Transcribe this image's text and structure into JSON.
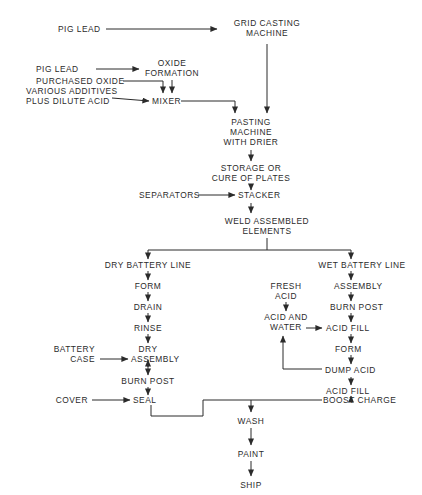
{
  "diagram": {
    "line_color": "#2b2b2b",
    "background": "#ffffff",
    "nodes": {
      "pig_lead_1": "PIG LEAD",
      "grid_casting_l1": "GRID CASTING",
      "grid_casting_l2": "MACHINE",
      "pig_lead_2": "PIG LEAD",
      "purchased_oxide": "PURCHASED OXIDE",
      "oxide_formation_l1": "OXIDE",
      "oxide_formation_l2": "FORMATION",
      "various_additives_l1": "VARIOUS ADDITIVES",
      "various_additives_l2": "PLUS DILUTE ACID",
      "mixer": "MIXER",
      "pasting_l1": "PASTING",
      "pasting_l2": "MACHINE",
      "pasting_l3": "WITH DRIER",
      "storage_l1": "STORAGE OR",
      "storage_l2": "CURE OF PLATES",
      "separators": "SEPARATORS",
      "stacker": "STACKER",
      "weld_l1": "WELD ASSEMBLED",
      "weld_l2": "ELEMENTS",
      "dry_battery_line": "DRY BATTERY LINE",
      "dry_form": "FORM",
      "dry_drain": "DRAIN",
      "dry_rinse": "RINSE",
      "dry_dry": "DRY",
      "battery_case_l1": "BATTERY",
      "battery_case_l2": "CASE",
      "dry_assembly": "ASSEMBLY",
      "dry_burn_post": "BURN POST",
      "cover": "COVER",
      "seal": "SEAL",
      "wet_battery_line": "WET BATTERY LINE",
      "wet_assembly": "ASSEMBLY",
      "wet_burn_post": "BURN POST",
      "wet_acid_fill_1": "ACID FILL",
      "wet_form": "FORM",
      "dump_acid": "DUMP ACID",
      "wet_acid_fill_2": "ACID FILL",
      "boost_charge": "BOOST CHARGE",
      "fresh_acid_l1": "FRESH",
      "fresh_acid_l2": "ACID",
      "acid_water_l1": "ACID AND",
      "acid_water_l2": "WATER",
      "wash": "WASH",
      "paint": "PAINT",
      "ship": "SHIP"
    }
  }
}
